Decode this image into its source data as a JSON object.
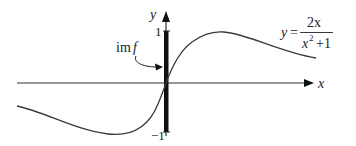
{
  "figure": {
    "type": "function-graph",
    "axes": {
      "x_label": "x",
      "y_label": "y",
      "y_ticks": [
        {
          "value": 1,
          "label": "1"
        },
        {
          "value": -1,
          "label": "−1"
        }
      ]
    },
    "function": {
      "lhs": "y",
      "equals": "=",
      "numerator": "2x",
      "denominator_base": "x",
      "denominator_exp": "2",
      "denominator_rest": "+1",
      "expression": "y = 2x/(x^2+1)"
    },
    "image_annotation": {
      "label_im": "im",
      "label_f": "f",
      "meaning": "image of f is the interval [-1, 1]"
    },
    "colors": {
      "axis": "#333333",
      "curve": "#3a3a3a",
      "image_bar": "#111111",
      "text": "#222222"
    }
  }
}
